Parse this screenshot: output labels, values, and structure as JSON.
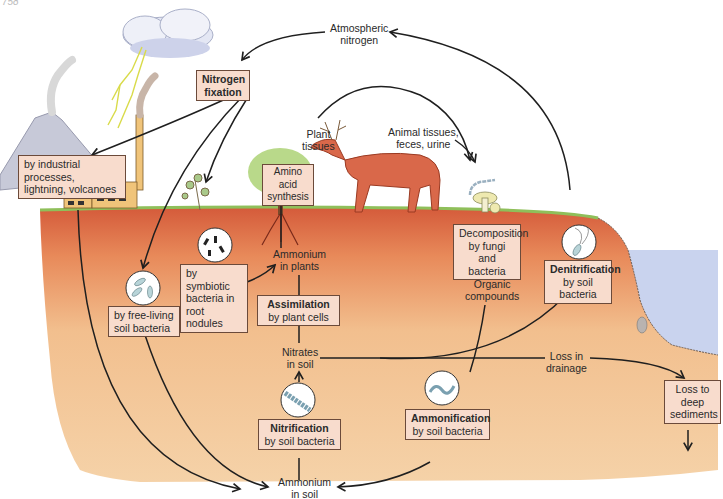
{
  "page_number": "758",
  "colors": {
    "sky": "#ffffff",
    "topsoil": "#d9603e",
    "subsoil": "#f2c79a",
    "water": "#c9d3ee",
    "grass": "#9bc46a",
    "label_box_fill": "#f8dccd",
    "label_box_border": "#6b4a3a",
    "arrow": "#1f1f1f",
    "deer": "#d9684a",
    "cloud": "#dfe3f2",
    "lightning": "#e8ea6a"
  },
  "nodes": {
    "atmospheric_nitrogen": {
      "line1": "Atmospheric",
      "line2": "nitrogen"
    },
    "nitrogen_fixation": {
      "title": "Nitrogen",
      "line2": "fixation"
    },
    "industrial": {
      "line1": "by industrial processes,",
      "line2": "lightning, volcanoes"
    },
    "free_living": {
      "line1": "by free-living",
      "line2": "soil bacteria"
    },
    "symbiotic": {
      "line1": "by symbiotic",
      "line2": "bacteria in",
      "line3": "root nodules"
    },
    "amino_acid": {
      "line1": "Amino acid",
      "line2": "synthesis"
    },
    "plant_tissues": {
      "line1": "Plant",
      "line2": "tissues"
    },
    "animal_tissues": {
      "line1": "Animal tissues,",
      "line2": "feces, urine"
    },
    "ammonium_plants": {
      "line1": "Ammonium",
      "line2": "in plants"
    },
    "assimilation": {
      "title": "Assimilation",
      "line2": "by plant cells"
    },
    "nitrates_soil": {
      "line1": "Nitrates",
      "line2": "in soil"
    },
    "nitrification": {
      "title": "Nitrification",
      "line2": "by soil bacteria"
    },
    "ammonium_soil": {
      "line1": "Ammonium",
      "line2": "in soil"
    },
    "decomposition": {
      "line1": "Decomposition",
      "line2": "by fungi",
      "line3": "and bacteria"
    },
    "organic_compounds": {
      "line1": "Organic",
      "line2": "compounds"
    },
    "ammonification": {
      "title": "Ammonification",
      "line2": "by soil bacteria"
    },
    "denitrification": {
      "title": "Denitrification",
      "line2": "by soil",
      "line3": "bacteria"
    },
    "loss_drainage": {
      "line1": "Loss in",
      "line2": "drainage"
    },
    "loss_sediments": {
      "line1": "Loss to",
      "line2": "deep",
      "line3": "sediments"
    }
  }
}
